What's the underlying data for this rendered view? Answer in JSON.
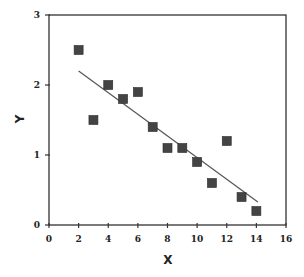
{
  "chart_data": {
    "type": "scatter",
    "title": "",
    "xlabel": "X",
    "ylabel": "Y",
    "xlim": [
      0,
      16
    ],
    "ylim": [
      0,
      3
    ],
    "xticks": [
      0,
      2,
      4,
      6,
      8,
      10,
      12,
      14,
      16
    ],
    "yticks": [
      0,
      1,
      2,
      3
    ],
    "grid": false,
    "legend": null,
    "series": [
      {
        "name": "data",
        "marker": "square",
        "color": "#444444",
        "points": [
          {
            "x": 2,
            "y": 2.5
          },
          {
            "x": 3,
            "y": 1.5
          },
          {
            "x": 4,
            "y": 2.0
          },
          {
            "x": 5,
            "y": 1.8
          },
          {
            "x": 6,
            "y": 1.9
          },
          {
            "x": 7,
            "y": 1.4
          },
          {
            "x": 8,
            "y": 1.1
          },
          {
            "x": 9,
            "y": 1.1
          },
          {
            "x": 10,
            "y": 0.9
          },
          {
            "x": 11,
            "y": 0.6
          },
          {
            "x": 12,
            "y": 1.2
          },
          {
            "x": 13,
            "y": 0.4
          },
          {
            "x": 14,
            "y": 0.2
          }
        ]
      }
    ],
    "fit_line": {
      "name": "linear fit",
      "color": "#555555",
      "start": {
        "x": 2,
        "y": 2.2
      },
      "end": {
        "x": 14.1,
        "y": 0.33
      }
    }
  },
  "plot": {
    "left": 49,
    "right": 286,
    "top": 15,
    "bottom": 225,
    "axis_color": "#333333",
    "marker_size": 9
  }
}
